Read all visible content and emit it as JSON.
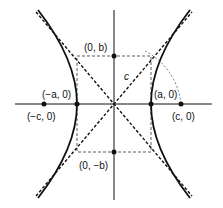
{
  "diagram": {
    "labels": {
      "vertex_left": "(−a, 0)",
      "vertex_right": "(a, 0)",
      "focus_left": "(−c, 0)",
      "focus_right": "(c, 0)",
      "co_vertex_top": "(0, b)",
      "co_vertex_bottom": "(0, −b)",
      "c_label": "c"
    },
    "colors": {
      "stroke": "#111111",
      "background": "#ffffff"
    }
  }
}
